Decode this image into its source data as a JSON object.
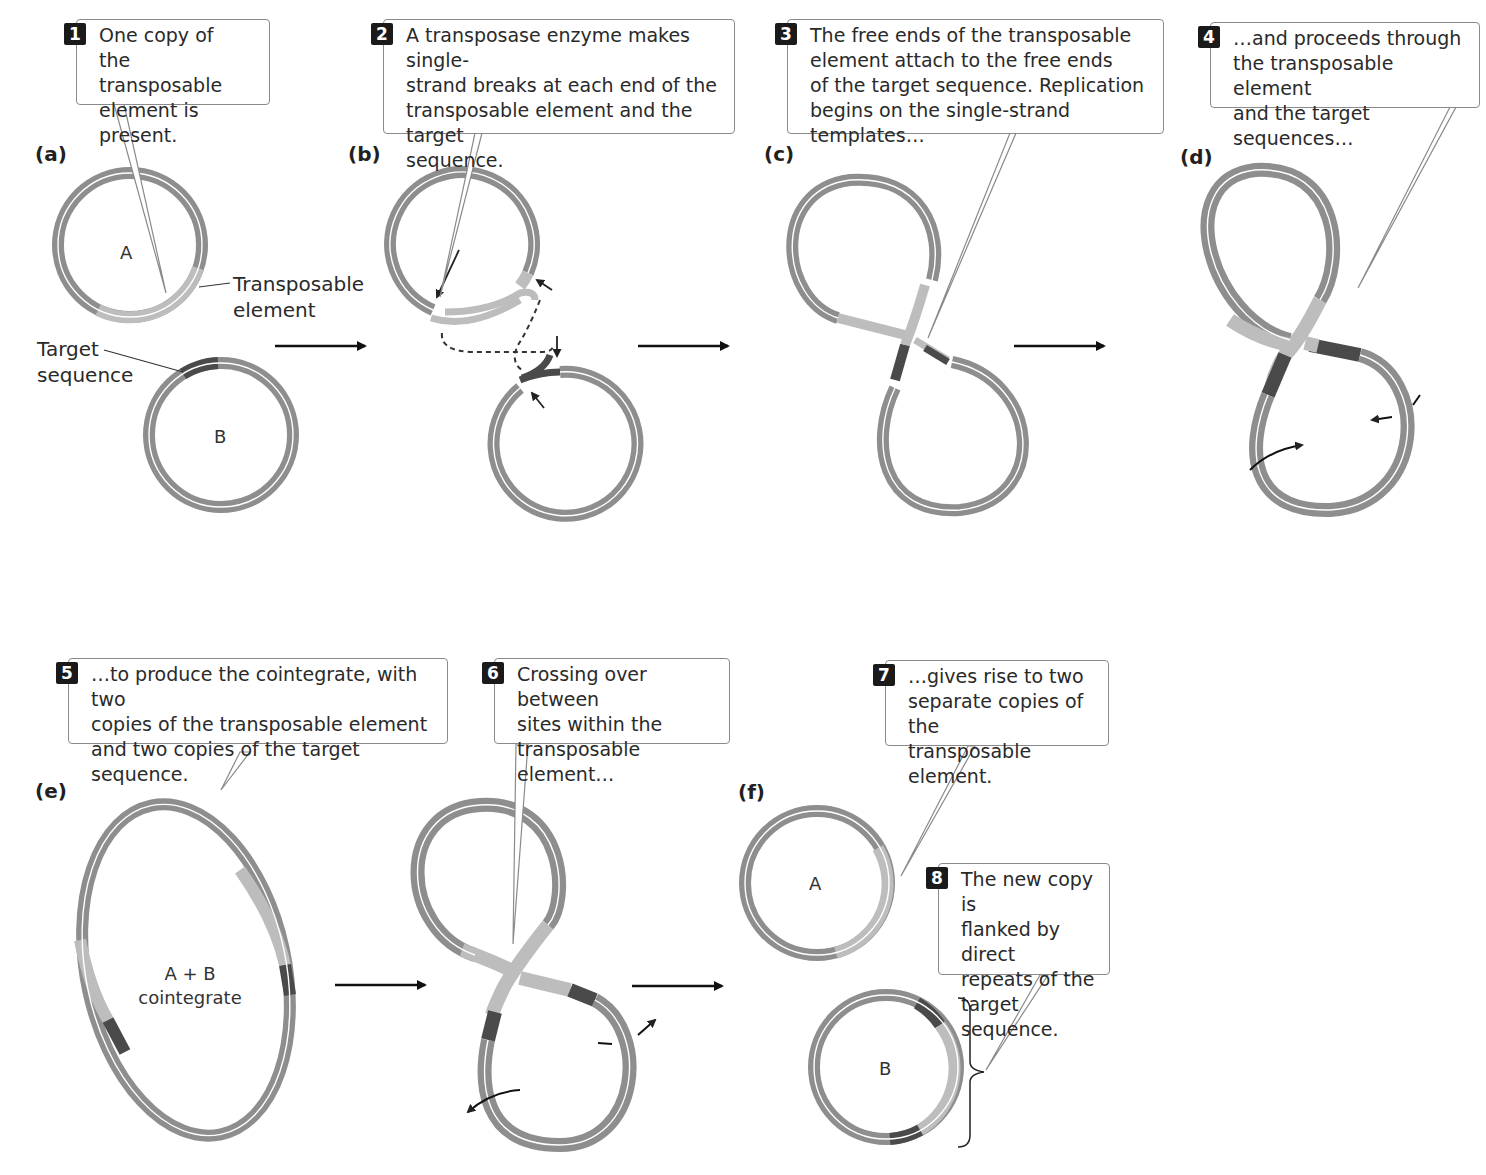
{
  "figure": {
    "colors": {
      "plasmid_backbone": "#8e8e8e",
      "transposable_element": "#bdbdbd",
      "target_sequence": "#4a4a4a",
      "callout_border": "#8a8a8a",
      "step_badge": "#1a1a1a"
    }
  },
  "panels": [
    {
      "id": "a",
      "label": "(a)"
    },
    {
      "id": "b",
      "label": "(b)"
    },
    {
      "id": "c",
      "label": "(c)"
    },
    {
      "id": "d",
      "label": "(d)"
    },
    {
      "id": "e",
      "label": "(e)"
    },
    {
      "id": "f",
      "label": "(f)"
    }
  ],
  "steps": [
    {
      "number": "1",
      "text": "One copy of\nthe transposable\nelement is present."
    },
    {
      "number": "2",
      "text": "A transposase enzyme makes single-\nstrand breaks at each end of the\ntransposable element and the target\nsequence."
    },
    {
      "number": "3",
      "text": "The free ends of the transposable\nelement attach to the free ends\nof the target sequence. Replication\nbegins on the single-strand templates…"
    },
    {
      "number": "4",
      "text": "…and proceeds through\nthe transposable element\nand the target sequences…"
    },
    {
      "number": "5",
      "text": "…to produce the cointegrate, with two\ncopies of the transposable element\nand two copies of the target sequence."
    },
    {
      "number": "6",
      "text": "Crossing over between\nsites within the\ntransposable element…"
    },
    {
      "number": "7",
      "text": "…gives rise to two\nseparate copies of the\ntransposable element."
    },
    {
      "number": "8",
      "text": "The new copy is\nflanked by direct\nrepeats of the\ntarget sequence."
    }
  ],
  "labels": {
    "transposable_element": "Transposable\nelement",
    "target_sequence": "Target\nsequence",
    "plasmid_a": "A",
    "plasmid_b": "B",
    "cointegrate": "A + B\ncointegrate",
    "plasmid_a_final": "A",
    "plasmid_b_final": "B"
  }
}
